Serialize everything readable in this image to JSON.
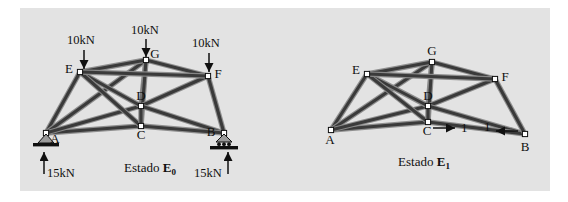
{
  "figure": {
    "panel_bg": "#e3e3e3",
    "page_bg": "#ffffff",
    "member_color": "#3a3a3a",
    "member_light": "#8a8a8a",
    "ink": "#101010"
  },
  "diagrams": [
    {
      "id": "E0",
      "caption_text": "Estado ",
      "caption_symbol": "E",
      "caption_subscript": "0",
      "nodes": [
        {
          "name": "A",
          "label": "A",
          "x": 46,
          "y": 133,
          "label_dx": 9,
          "label_dy": 10
        },
        {
          "name": "B",
          "label": "B",
          "x": 224,
          "y": 133,
          "label_dx": -13,
          "label_dy": 3
        },
        {
          "name": "C",
          "label": "C",
          "x": 141,
          "y": 126,
          "label_dx": 0,
          "label_dy": 13
        },
        {
          "name": "D",
          "label": "D",
          "x": 141,
          "y": 106,
          "label_dx": 0,
          "label_dy": -6
        },
        {
          "name": "E",
          "label": "E",
          "x": 80,
          "y": 72,
          "label_dx": -11,
          "label_dy": 1
        },
        {
          "name": "F",
          "label": "F",
          "x": 208,
          "y": 76,
          "label_dx": 10,
          "label_dy": 2
        },
        {
          "name": "G",
          "label": "G",
          "x": 146,
          "y": 60,
          "label_dx": 9,
          "label_dy": -2
        }
      ],
      "members": [
        [
          "A",
          "E"
        ],
        [
          "A",
          "G"
        ],
        [
          "A",
          "C"
        ],
        [
          "A",
          "D"
        ],
        [
          "E",
          "G"
        ],
        [
          "E",
          "D"
        ],
        [
          "E",
          "C"
        ],
        [
          "G",
          "D"
        ],
        [
          "G",
          "F"
        ],
        [
          "G",
          "C"
        ],
        [
          "D",
          "C"
        ],
        [
          "D",
          "F"
        ],
        [
          "D",
          "B"
        ],
        [
          "C",
          "B"
        ],
        [
          "F",
          "B"
        ],
        [
          "E",
          "F"
        ]
      ],
      "loads": [
        {
          "name": "load-E",
          "text": "10kN",
          "node": "E",
          "tx": 67,
          "ty": 44,
          "ax": 84,
          "ay": 50,
          "ay2": 69
        },
        {
          "name": "load-G",
          "text": "10kN",
          "node": "G",
          "tx": 131,
          "ty": 34,
          "ax": 146,
          "ay": 39,
          "ay2": 57
        },
        {
          "name": "load-F",
          "text": "10kN",
          "node": "F",
          "tx": 192,
          "ty": 47,
          "ax": 209,
          "ay": 53,
          "ay2": 72
        }
      ],
      "reactions": [
        {
          "name": "reaction-A",
          "text": "15kN",
          "tx": 47,
          "ty": 177,
          "ax": 44,
          "ay": 174,
          "ay2": 152
        },
        {
          "name": "reaction-B",
          "text": "15kN",
          "tx": 194,
          "ty": 177,
          "ax": 228,
          "ay": 174,
          "ay2": 152
        }
      ],
      "supports": [
        {
          "name": "support-pin-A",
          "type": "pin",
          "x": 46,
          "y": 134
        },
        {
          "name": "support-roller-B",
          "type": "roller",
          "x": 224,
          "y": 134
        }
      ],
      "caption_x": 150,
      "caption_y": 172
    },
    {
      "id": "E1",
      "caption_text": "Estado ",
      "caption_symbol": "E",
      "caption_subscript": "1",
      "nodes": [
        {
          "name": "A",
          "label": "A",
          "x": 331,
          "y": 130,
          "label_dx": -1,
          "label_dy": 14
        },
        {
          "name": "B",
          "label": "B",
          "x": 525,
          "y": 134,
          "label_dx": 0,
          "label_dy": 17
        },
        {
          "name": "C",
          "label": "C",
          "x": 428,
          "y": 122,
          "label_dx": -1,
          "label_dy": 13
        },
        {
          "name": "D",
          "label": "D",
          "x": 428,
          "y": 106,
          "label_dx": 0,
          "label_dy": -6
        },
        {
          "name": "E",
          "label": "E",
          "x": 367,
          "y": 74,
          "label_dx": -11,
          "label_dy": 0
        },
        {
          "name": "F",
          "label": "F",
          "x": 495,
          "y": 79,
          "label_dx": 10,
          "label_dy": 2
        },
        {
          "name": "G",
          "label": "G",
          "x": 432,
          "y": 62,
          "label_dx": 0,
          "label_dy": -7
        }
      ],
      "members": [
        [
          "A",
          "E"
        ],
        [
          "A",
          "G"
        ],
        [
          "A",
          "C"
        ],
        [
          "A",
          "D"
        ],
        [
          "E",
          "G"
        ],
        [
          "E",
          "D"
        ],
        [
          "E",
          "C"
        ],
        [
          "G",
          "D"
        ],
        [
          "G",
          "F"
        ],
        [
          "G",
          "C"
        ],
        [
          "D",
          "C"
        ],
        [
          "D",
          "F"
        ],
        [
          "D",
          "B"
        ],
        [
          "C",
          "B"
        ],
        [
          "F",
          "B"
        ],
        [
          "E",
          "F"
        ]
      ],
      "unit_loads": [
        {
          "name": "unit-load-C",
          "text": "1",
          "x1": 433,
          "y1": 128,
          "x2": 455,
          "y2": 128,
          "tx": 461,
          "ty": 132
        },
        {
          "name": "unit-load-B",
          "text": "1",
          "x1": 518,
          "y1": 131,
          "x2": 496,
          "y2": 131,
          "tx": 484,
          "ty": 131
        }
      ],
      "caption_x": 424,
      "caption_y": 166
    }
  ]
}
